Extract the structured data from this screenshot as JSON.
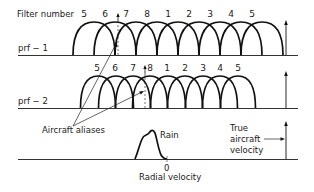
{
  "diagram": {
    "filter_number_label": "Filter number",
    "rows": [
      {
        "label": "prf − 1",
        "filter_numbers": [
          "5",
          "6",
          "7",
          "8",
          "1",
          "2",
          "3",
          "4",
          "5"
        ],
        "filter_positions": [
          94,
          115,
          136,
          157,
          178,
          199,
          220,
          241,
          262
        ],
        "baseline_y": 55,
        "arc_half_width": 21,
        "arc_peak_y": 22
      },
      {
        "label": "prf − 2",
        "filter_numbers": [
          "5",
          "6",
          "7",
          "8",
          "1",
          "2",
          "3",
          "4",
          "5"
        ],
        "filter_positions": [
          98,
          116,
          133,
          150,
          168,
          185,
          203,
          220,
          238
        ],
        "baseline_y": 108,
        "arc_half_width": 17.5,
        "arc_peak_y": 76
      }
    ],
    "annotations": {
      "aircraft_aliases": "Aircraft aliases",
      "rain": "Rain",
      "true_velocity_line1": "True",
      "true_velocity_line2": "aircraft",
      "true_velocity_line3": "velocity",
      "zero": "0",
      "x_axis": "Radial velocity"
    },
    "colors": {
      "line": "#111111",
      "background": "#ffffff"
    }
  }
}
